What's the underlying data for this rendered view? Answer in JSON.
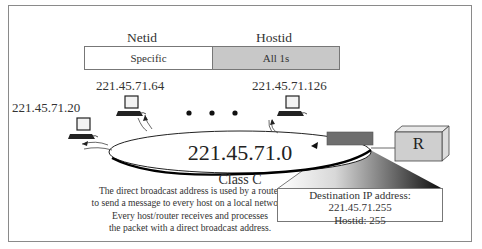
{
  "address_format": {
    "netid_label": "Netid",
    "hostid_label": "Hostid",
    "netid_value": "Specific",
    "hostid_value": "All 1s"
  },
  "hosts": [
    {
      "ip": "221.45.71.20"
    },
    {
      "ip": "221.45.71.64"
    },
    {
      "ip": "221.45.71.126"
    }
  ],
  "ellipsis": "• • •",
  "network": {
    "address": "221.45.71.0",
    "class_label": "Class C"
  },
  "router": {
    "label": "R"
  },
  "description": [
    "The direct broadcast address is used by a router",
    "to send a message to every host on a local network.",
    "Every host/router receives and processes",
    "the packet with a direct broadcast address."
  ],
  "destination_box": {
    "title": "Destination IP address:",
    "address": "221.45.71.255",
    "hostid": "Hostid: 255"
  },
  "colors": {
    "hostid_fill": "#c8c8c8",
    "packet_fill": "#6e6e6e",
    "router_fill": "#cfcfcf",
    "frame_border": "#8a8a8a"
  }
}
